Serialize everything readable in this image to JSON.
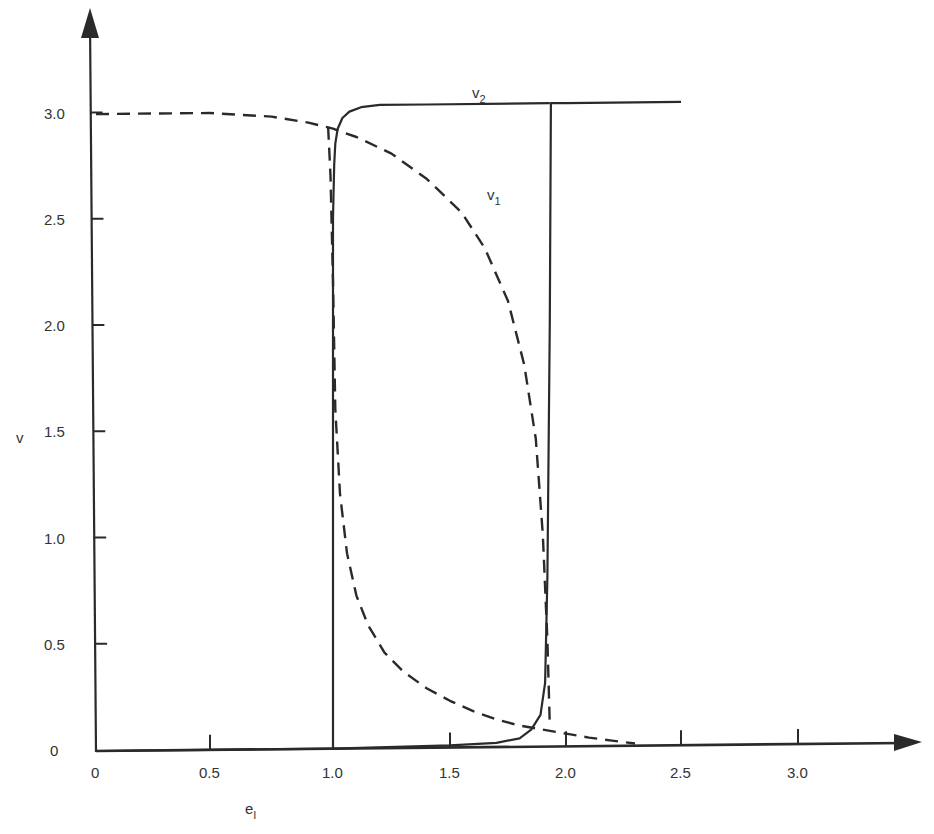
{
  "chart_data": {
    "type": "line",
    "title": "",
    "xlabel": "e",
    "xlabel_subscript": "I",
    "ylabel": "v",
    "xlim": [
      0,
      3.4
    ],
    "ylim": [
      0,
      3.3
    ],
    "grid": false,
    "legend": "inline labels",
    "x_ticks": [
      "0",
      "0.5",
      "1.0",
      "1.5",
      "2.0",
      "2.5",
      "3.0"
    ],
    "y_ticks": [
      "0",
      "0.5",
      "1.0",
      "1.5",
      "2.0",
      "2.5",
      "3.0"
    ],
    "series": [
      {
        "name": "v1",
        "label": "v",
        "label_sub": "1",
        "style": "dashed",
        "branches": [
          {
            "x": [
              0,
              0.25,
              0.5,
              0.75,
              0.9,
              1.0,
              1.1,
              1.25,
              1.4,
              1.55,
              1.65,
              1.75,
              1.82,
              1.87,
              1.9,
              1.92,
              1.93
            ],
            "y": [
              3.0,
              3.0,
              3.0,
              2.98,
              2.95,
              2.92,
              2.88,
              2.8,
              2.68,
              2.52,
              2.35,
              2.1,
              1.8,
              1.45,
              1.0,
              0.5,
              0.1
            ]
          },
          {
            "x": [
              0.98,
              0.99,
              1.0,
              1.01,
              1.03,
              1.06,
              1.1,
              1.15,
              1.22,
              1.3,
              1.4,
              1.5,
              1.6,
              1.7,
              1.8,
              1.9,
              2.0,
              2.1,
              2.2,
              2.3
            ],
            "y": [
              2.93,
              2.7,
              2.2,
              1.6,
              1.2,
              0.92,
              0.72,
              0.58,
              0.45,
              0.36,
              0.28,
              0.22,
              0.17,
              0.13,
              0.1,
              0.08,
              0.06,
              0.04,
              0.025,
              0.01
            ]
          }
        ]
      },
      {
        "name": "v2",
        "label": "v",
        "label_sub": "2",
        "style": "solid",
        "branches": [
          {
            "x": [
              0,
              0.5,
              1.0,
              1.5,
              1.7,
              1.8,
              1.85,
              1.89,
              1.91,
              1.92,
              1.93,
              1.935,
              2.0,
              2.5
            ],
            "y": [
              0,
              0,
              0,
              0.01,
              0.02,
              0.04,
              0.08,
              0.15,
              0.3,
              0.8,
              2.0,
              3.03,
              3.03,
              3.03
            ]
          },
          {
            "x": [
              1.0,
              1.0,
              1.005,
              1.01,
              1.02,
              1.04,
              1.07,
              1.12,
              1.2,
              1.4,
              1.93
            ],
            "y": [
              0,
              2.5,
              2.75,
              2.85,
              2.92,
              2.97,
              3.0,
              3.02,
              3.03,
              3.03,
              3.03
            ]
          }
        ]
      }
    ]
  }
}
